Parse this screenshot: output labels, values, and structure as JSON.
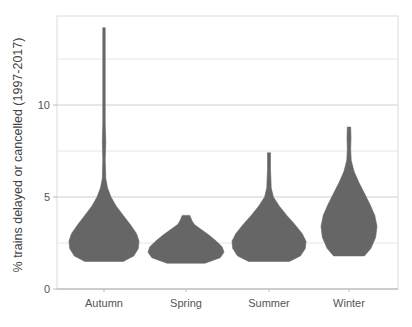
{
  "chart_data": {
    "type": "violin",
    "title": "",
    "xlabel": "",
    "ylabel": "% trains delayed or cancelled (1997-2017)",
    "ylim": [
      0,
      14.5
    ],
    "yticks": [
      0,
      5,
      10
    ],
    "ytick_labels": [
      "0",
      "5",
      "10"
    ],
    "minor_gridlines": [
      2.5,
      7.5,
      12.5
    ],
    "grid": true,
    "legend": null,
    "categories": [
      "Autumn",
      "Spring",
      "Summer",
      "Winter"
    ],
    "fill_color": "#666666",
    "series": [
      {
        "name": "Autumn",
        "min": 1.5,
        "max": 14.2,
        "mode": 2.5,
        "profile": [
          [
            1.5,
            0.55
          ],
          [
            1.8,
            0.85
          ],
          [
            2.2,
            0.98
          ],
          [
            2.6,
            1.0
          ],
          [
            3.0,
            0.93
          ],
          [
            3.5,
            0.75
          ],
          [
            4.0,
            0.55
          ],
          [
            4.5,
            0.35
          ],
          [
            5.0,
            0.2
          ],
          [
            5.5,
            0.1
          ],
          [
            6.0,
            0.05
          ],
          [
            7.0,
            0.03
          ],
          [
            8.0,
            0.05
          ],
          [
            9.0,
            0.02
          ],
          [
            10.0,
            0.015
          ],
          [
            12.0,
            0.015
          ],
          [
            14.0,
            0.025
          ],
          [
            14.2,
            0.02
          ]
        ]
      },
      {
        "name": "Spring",
        "min": 1.4,
        "max": 4.0,
        "mode": 2.2,
        "profile": [
          [
            1.4,
            0.5
          ],
          [
            1.7,
            0.9
          ],
          [
            2.0,
            1.0
          ],
          [
            2.3,
            0.95
          ],
          [
            2.6,
            0.8
          ],
          [
            2.9,
            0.62
          ],
          [
            3.2,
            0.42
          ],
          [
            3.5,
            0.22
          ],
          [
            3.7,
            0.16
          ],
          [
            4.0,
            0.1
          ]
        ]
      },
      {
        "name": "Summer",
        "min": 1.5,
        "max": 7.4,
        "mode": 2.5,
        "profile": [
          [
            1.5,
            0.55
          ],
          [
            1.8,
            0.85
          ],
          [
            2.2,
            0.98
          ],
          [
            2.6,
            1.0
          ],
          [
            3.0,
            0.9
          ],
          [
            3.5,
            0.7
          ],
          [
            4.0,
            0.48
          ],
          [
            4.5,
            0.28
          ],
          [
            5.0,
            0.12
          ],
          [
            5.5,
            0.06
          ],
          [
            6.0,
            0.05
          ],
          [
            6.5,
            0.04
          ],
          [
            7.0,
            0.04
          ],
          [
            7.4,
            0.04
          ]
        ]
      },
      {
        "name": "Winter",
        "min": 1.8,
        "max": 8.8,
        "mode": 3.5,
        "profile": [
          [
            1.8,
            0.55
          ],
          [
            2.2,
            0.78
          ],
          [
            2.8,
            0.95
          ],
          [
            3.4,
            1.0
          ],
          [
            4.0,
            0.92
          ],
          [
            4.6,
            0.75
          ],
          [
            5.2,
            0.55
          ],
          [
            5.8,
            0.35
          ],
          [
            6.4,
            0.18
          ],
          [
            7.0,
            0.08
          ],
          [
            7.6,
            0.06
          ],
          [
            8.2,
            0.07
          ],
          [
            8.8,
            0.06
          ]
        ]
      }
    ]
  }
}
